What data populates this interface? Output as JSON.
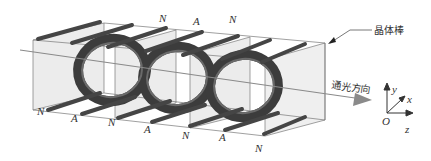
{
  "diagram": {
    "title_label": "晶体棒",
    "light_direction_label": "通光方向",
    "top_labels": [
      "N",
      "A",
      "N"
    ],
    "bottom_labels": [
      "N",
      "A",
      "N",
      "A",
      "N",
      "A",
      "N"
    ],
    "axes": {
      "origin": "O",
      "x": "x",
      "y": "y",
      "z": "z"
    },
    "colors": {
      "ring": "#3a3a3a",
      "rod": "#444444",
      "plate": "#d9d9d9",
      "frame": "#777777",
      "arrow": "#8a8a8a"
    }
  }
}
